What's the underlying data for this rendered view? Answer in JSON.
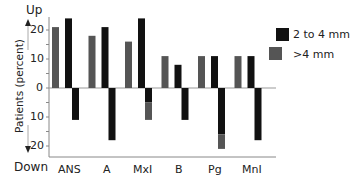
{
  "chart_data": {
    "type": "bar",
    "title": "",
    "xlabel": "",
    "ylabel": "Patients (percent)",
    "y_direction_labels": {
      "up": "Up",
      "down": "Down"
    },
    "ylim": [
      -20,
      20
    ],
    "yticks": [
      20,
      10,
      0,
      10,
      20
    ],
    "categories": [
      "ANS",
      "A",
      "MxI",
      "B",
      "Pg",
      "MnI"
    ],
    "series": [
      {
        "name": "2 to 4 mm",
        "color": "#111111",
        "up": [
          24,
          21,
          24,
          8,
          11,
          11
        ],
        "down": [
          11,
          18,
          5,
          11,
          16,
          18
        ]
      },
      {
        "name": ">4 mm",
        "color": "#555555",
        "up": [
          21,
          18,
          16,
          11,
          11,
          11
        ],
        "down": [
          0,
          0,
          6,
          0,
          5,
          0
        ]
      }
    ],
    "legend_position": "right"
  },
  "legend": {
    "items": [
      {
        "label": "2 to 4 mm",
        "color": "#111111"
      },
      {
        "label": ">4 mm",
        "color": "#555555"
      }
    ]
  },
  "axis": {
    "up_label": "Up",
    "down_label": "Down",
    "ylabel": "Patients (percent)",
    "tick_labels": [
      "20",
      "10",
      "0",
      "10",
      "20"
    ]
  }
}
